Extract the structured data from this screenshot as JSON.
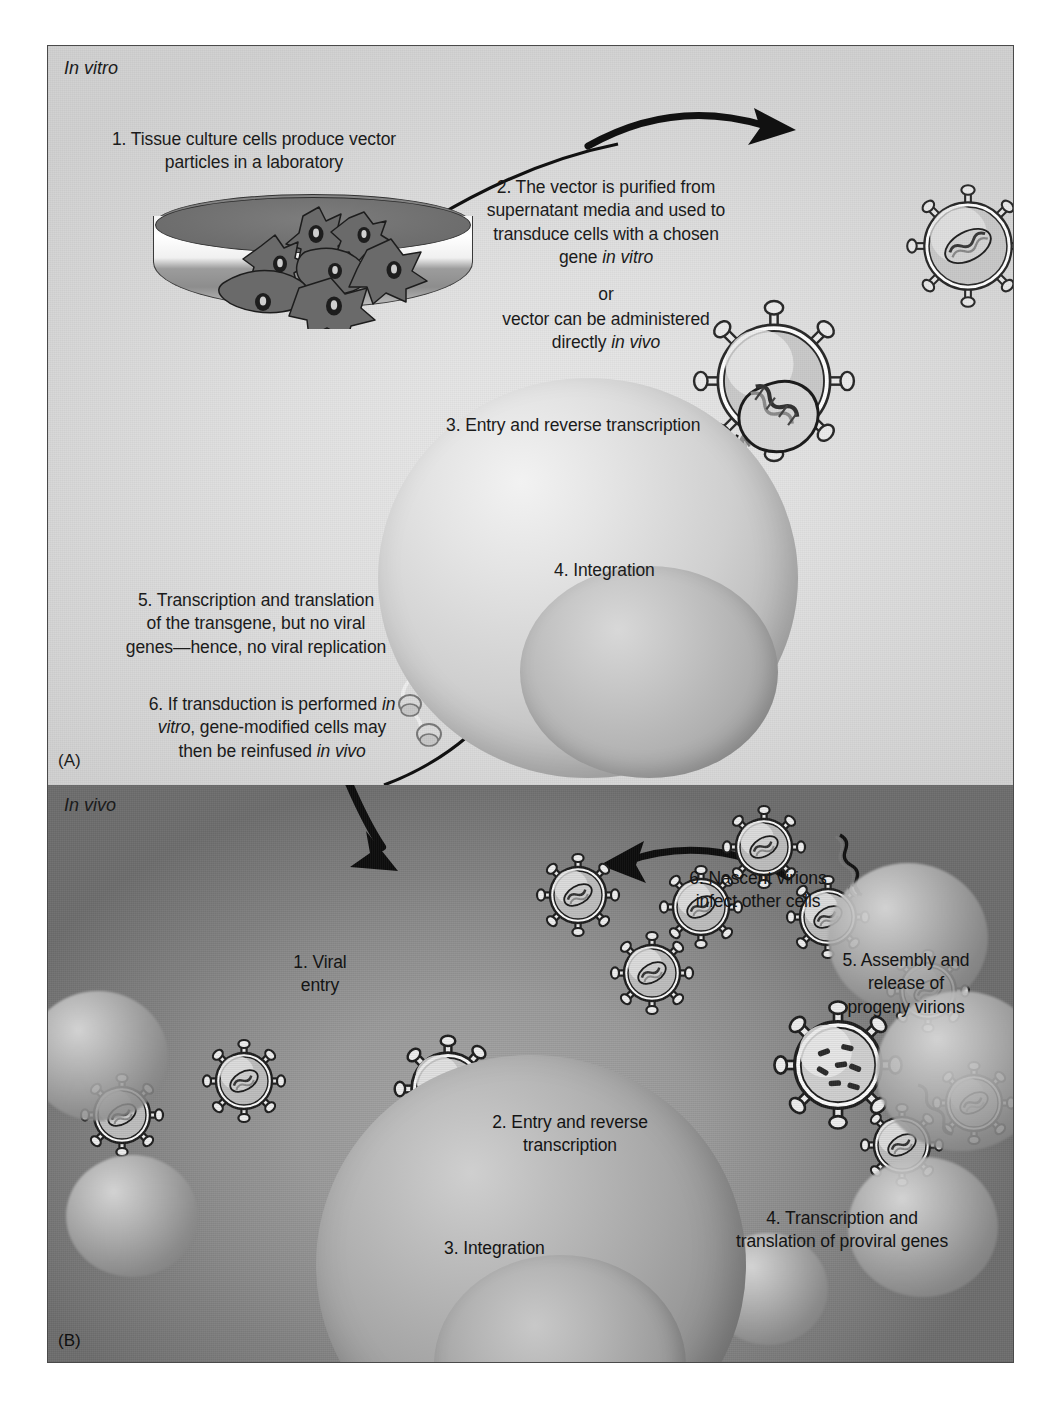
{
  "figure": {
    "panel_a": {
      "label": "(A)",
      "environment_label": "In vitro",
      "steps": [
        {
          "id": 1,
          "text": "1. Tissue culture cells produce vector particles in a laboratory"
        },
        {
          "id": 2,
          "text": "2. The vector is purified from supernatant media and used to transduce cells with a chosen gene in vitro"
        },
        {
          "id": "or",
          "text": "or"
        },
        {
          "id": "2b",
          "text": "vector can be administered directly in vivo"
        },
        {
          "id": 3,
          "text": "3. Entry and reverse transcription"
        },
        {
          "id": 4,
          "text": "4. Integration"
        },
        {
          "id": 5,
          "text": "5. Transcription and translation of the transgene, but no viral genes—hence, no viral replication"
        },
        {
          "id": 6,
          "text": "6. If transduction is performed in vitro, gene-modified cells may then be reinfused in vivo"
        }
      ],
      "step1_lines": [
        "1. Tissue culture cells produce vector",
        "particles in a laboratory"
      ],
      "step2_lines": [
        "2. The vector is purified from",
        "supernatant media and used to",
        "transduce cells with a chosen",
        "gene in vitro"
      ],
      "or_line": "or",
      "step2b_lines": [
        "vector can be administered",
        "directly in vivo"
      ],
      "step3_line": "3. Entry and reverse transcription",
      "step4_line": "4. Integration",
      "step5_lines": [
        "5. Transcription and translation",
        "of the transgene, but no viral",
        "genes—hence, no viral replication"
      ],
      "step6_lines": [
        "6. If transduction is performed in",
        "vitro, gene-modified cells may",
        "then be reinfused in vivo"
      ],
      "italic_terms": [
        "in vitro",
        "in vivo"
      ]
    },
    "panel_b": {
      "label": "(B)",
      "environment_label": "In vivo",
      "steps": [
        {
          "id": 1,
          "text": "1. Viral entry"
        },
        {
          "id": 2,
          "text": "2. Entry and reverse transcription"
        },
        {
          "id": 3,
          "text": "3. Integration"
        },
        {
          "id": 4,
          "text": "4. Transcription and translation of proviral genes"
        },
        {
          "id": 5,
          "text": "5. Assembly and release of progeny virions"
        },
        {
          "id": 6,
          "text": "6. Nascent virions infect other cells"
        }
      ],
      "step1_lines": [
        "1. Viral",
        "entry"
      ],
      "step2_lines": [
        "2. Entry and reverse",
        "transcription"
      ],
      "step3_line": "3. Integration",
      "step4_lines": [
        "4. Transcription and",
        "translation of proviral genes"
      ],
      "step5_lines": [
        "5. Assembly and",
        "release of",
        "progeny virions"
      ],
      "step6_lines": [
        "6. Nascent virions",
        "infect other cells"
      ]
    },
    "elements": {
      "petri_dish": "petri-dish",
      "virion": "virion-particle",
      "cell": "host-cell",
      "nucleus": "cell-nucleus",
      "dna": "dna-helix",
      "rna": "rna-strand",
      "ribosome": "ribosome",
      "protein": "protein-blob",
      "arrow": "flow-arrow"
    },
    "colors": {
      "panel_a_background": "#e2e2e2",
      "panel_b_background": "#8a8a8a",
      "text": "#1b1b1b",
      "frame_border": "#4a4a4a",
      "dish_media": "#7d7d7d",
      "page_background": "#ffffff"
    }
  }
}
